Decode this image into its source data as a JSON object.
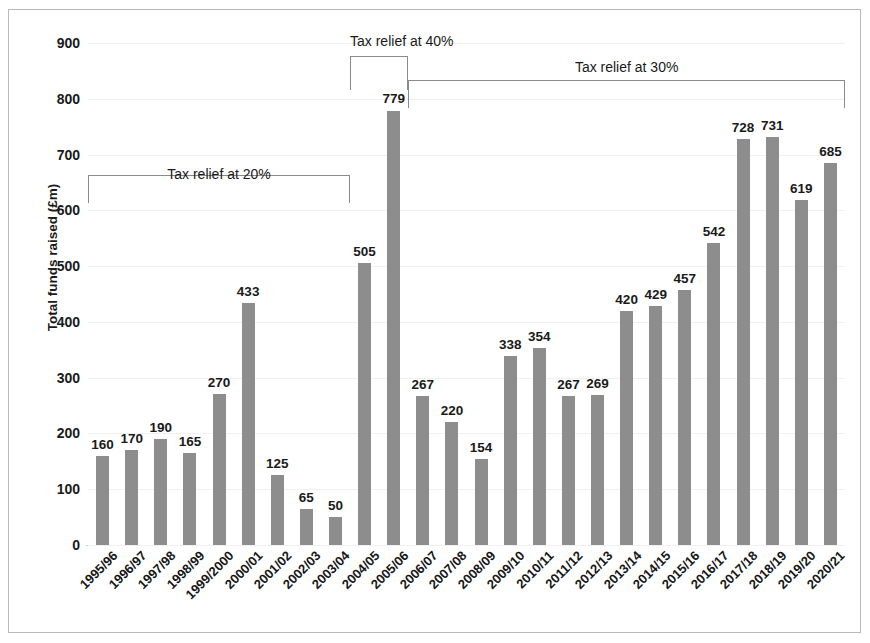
{
  "chart_data": {
    "type": "bar",
    "title": "",
    "xlabel": "",
    "ylabel": "Total funds raised (£m)",
    "ylim": [
      0,
      900
    ],
    "ytick_step": 100,
    "yticks": [
      "900",
      "800",
      "700",
      "600",
      "500",
      "400",
      "300",
      "200",
      "100",
      "0"
    ],
    "grid": true,
    "legend": "none",
    "bar_color": "#8d8d8d",
    "categories": [
      "1995/96",
      "1996/97",
      "1997/98",
      "1998/99",
      "1999/2000",
      "2000/01",
      "2001/02",
      "2002/03",
      "2003/04",
      "2004/05",
      "2005/06",
      "2006/07",
      "2007/08",
      "2008/09",
      "2009/10",
      "2010/11",
      "2011/12",
      "2012/13",
      "2013/14",
      "2014/15",
      "2015/16",
      "2016/17",
      "2017/18",
      "2018/19",
      "2019/20",
      "2020/21"
    ],
    "values": [
      160,
      170,
      190,
      165,
      270,
      433,
      125,
      65,
      50,
      505,
      779,
      267,
      220,
      154,
      338,
      354,
      267,
      269,
      420,
      429,
      457,
      542,
      728,
      731,
      619,
      685
    ],
    "annotations": [
      {
        "label": "Tax relief at 20%",
        "start_category": "1995/96",
        "end_category": "2003/04"
      },
      {
        "label": "Tax relief at 40%",
        "start_category": "2004/05",
        "end_category": "2005/06"
      },
      {
        "label": "Tax relief at 30%",
        "start_category": "2006/07",
        "end_category": "2020/21"
      }
    ]
  }
}
